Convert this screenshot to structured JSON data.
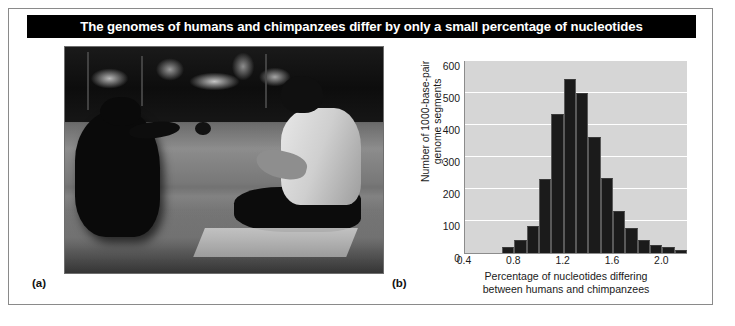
{
  "figure": {
    "title": "The genomes of humans and chimpanzees differ by only a small percentage of nucleotides",
    "title_bar_color": "#000000",
    "title_text_color": "#ffffff",
    "card_background": "#ffffff",
    "card_border_color": "#8a8a8a"
  },
  "panels": {
    "a": {
      "label": "(a)",
      "image_description": "Black-and-white photograph of a chimpanzee seated on grass facing a person in a white t-shirt sitting cross-legged on a mat in a park"
    },
    "b": {
      "label": "(b)"
    }
  },
  "chart_data": {
    "type": "bar",
    "title": "",
    "subtitle": "",
    "xlabel": "Percentage of nucleotides differing\nbetween humans and chimpanzees",
    "ylabel": "Number of 1000-base-pair\ngenome segments",
    "xlim": [
      0.4,
      2.2
    ],
    "ylim": [
      0,
      600
    ],
    "xticks": [
      0.4,
      0.8,
      1.2,
      1.6,
      2.0
    ],
    "xtick_labels": [
      "0.4",
      "0.8",
      "1.2",
      "1.6",
      "2.0"
    ],
    "yticks": [
      0,
      100,
      200,
      300,
      400,
      500,
      600
    ],
    "ytick_labels": [
      "0",
      "100",
      "200",
      "300",
      "400",
      "500",
      "600"
    ],
    "grid": "horizontal-white",
    "legend": "none",
    "plot_background": "#d6d6d6",
    "bar_color": "#1b1b1b",
    "bin_width": 0.1,
    "categories": [
      "0.7",
      "0.8",
      "0.9",
      "1.0",
      "1.1",
      "1.2",
      "1.3",
      "1.4",
      "1.5",
      "1.6",
      "1.7",
      "1.8",
      "1.9",
      "2.0",
      "2.1"
    ],
    "bin_starts": [
      0.7,
      0.8,
      0.9,
      1.0,
      1.1,
      1.2,
      1.3,
      1.4,
      1.5,
      1.6,
      1.7,
      1.8,
      1.9,
      2.0,
      2.1
    ],
    "values": [
      20,
      40,
      85,
      232,
      435,
      545,
      500,
      363,
      235,
      130,
      78,
      40,
      25,
      20,
      8
    ]
  }
}
